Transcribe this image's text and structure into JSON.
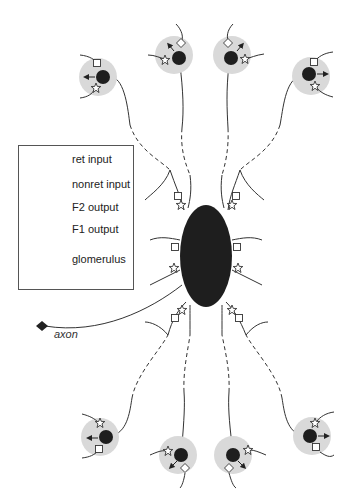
{
  "figure": {
    "type": "neuron-schematic",
    "colors": {
      "glomerulus": "#d9d9d9",
      "cell_body": "#1e1e1e",
      "stroke": "#333333",
      "background": "#ffffff"
    }
  },
  "legend": {
    "items": [
      {
        "icon": "square-icon",
        "label": "ret input"
      },
      {
        "icon": "star-icon",
        "label": "nonret input"
      },
      {
        "icon": "filled-circle-arrow-icon",
        "label": "F2 output"
      },
      {
        "icon": "diamond-icon",
        "label": "F1 output"
      },
      {
        "icon": "gray-disc-icon",
        "label": "glomerulus"
      }
    ]
  },
  "labels": {
    "axon": "axon"
  }
}
